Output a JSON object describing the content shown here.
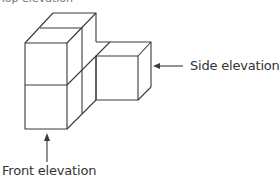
{
  "figure": {
    "type": "isometric block diagram",
    "top_cut_text": "Top elevation",
    "labels": {
      "side": "Side elevation",
      "front": "Front elevation"
    },
    "colors": {
      "stroke": "#3a3a3a",
      "text": "#333333",
      "background": "#ffffff"
    }
  }
}
